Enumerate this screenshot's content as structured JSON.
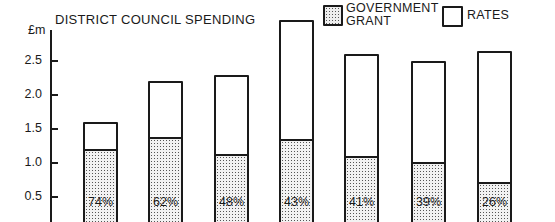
{
  "chart_data": {
    "type": "bar",
    "stacked": true,
    "title": "DISTRICT COUNCIL SPENDING",
    "ylabel": "£m",
    "xlabel": "",
    "ylim": [
      0,
      3.0
    ],
    "yticks": [
      "0.5",
      "1.0",
      "1.5",
      "2.0",
      "2.5"
    ],
    "categories": [
      "1",
      "2",
      "3",
      "4",
      "5",
      "6",
      "7"
    ],
    "series": [
      {
        "name": "GOVERNMENT GRANT",
        "values": [
          1.18,
          1.36,
          1.1,
          1.33,
          1.07,
          0.98,
          0.69
        ]
      },
      {
        "name": "RATES",
        "values": [
          0.42,
          0.84,
          1.2,
          1.77,
          1.53,
          1.52,
          1.96
        ]
      }
    ],
    "totals": [
      1.6,
      2.2,
      2.3,
      3.1,
      2.6,
      2.5,
      2.65
    ],
    "grant_percent_labels": [
      "74%",
      "62%",
      "48%",
      "43%",
      "41%",
      "39%",
      "26%"
    ],
    "legend": [
      "GOVERNMENT GRANT",
      "RATES"
    ],
    "legend_position": "top-right",
    "grid": false
  },
  "chart": {
    "title": "DISTRICT COUNCIL SPENDING",
    "unit": "£m",
    "legend": {
      "grant_line1": "GOVERNMENT",
      "grant_line2": "GRANT",
      "rates": "RATES"
    }
  }
}
